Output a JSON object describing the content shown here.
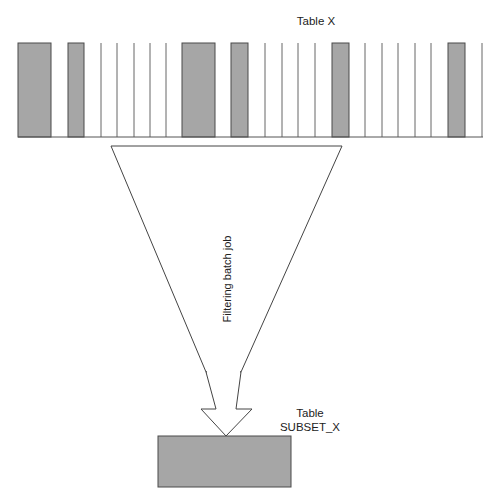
{
  "diagram": {
    "source_table": {
      "label": "Table X",
      "baseline": {
        "y": 137,
        "x1": 18,
        "x2": 483
      },
      "top_y": 43,
      "selected_rows": [
        {
          "x": 18,
          "w": 33
        },
        {
          "x": 68,
          "w": 16
        },
        {
          "x": 182,
          "w": 33
        },
        {
          "x": 231,
          "w": 17
        },
        {
          "x": 332,
          "w": 17
        },
        {
          "x": 448,
          "w": 17
        }
      ],
      "row_dividers": [
        101,
        117,
        134,
        150,
        166,
        265,
        282,
        298,
        315,
        365,
        382,
        398,
        415,
        431,
        482
      ]
    },
    "process": {
      "label": "Filtering batch job"
    },
    "target_table": {
      "label_line1": "Table",
      "label_line2": "SUBSET_X"
    },
    "colors": {
      "selected_fill": "#a6a6a6",
      "stroke": "#4a4a4a",
      "divider": "#666666"
    }
  }
}
